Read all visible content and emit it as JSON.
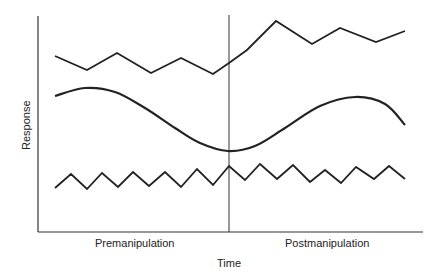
{
  "chart_data": {
    "type": "line",
    "title": "",
    "xlabel": "Time",
    "ylabel": "Response",
    "phases": [
      "Premanipulation",
      "Postmanipulation"
    ],
    "phase_divider_x": 229,
    "grid": false,
    "legend": null,
    "axes": {
      "x0": 38,
      "y0": 232,
      "x1": 423,
      "ytop": 16
    },
    "series": [
      {
        "name": "top-zigzag",
        "description": "Variable baseline, level increases after manipulation",
        "points": [
          [
            55,
            56
          ],
          [
            87,
            70
          ],
          [
            117,
            53
          ],
          [
            151,
            73
          ],
          [
            181,
            58
          ],
          [
            213,
            74
          ],
          [
            229,
            63
          ],
          [
            247,
            50
          ],
          [
            276,
            21
          ],
          [
            312,
            44
          ],
          [
            340,
            28
          ],
          [
            376,
            42
          ],
          [
            405,
            31
          ]
        ]
      },
      {
        "name": "smooth-curve",
        "description": "Cyclical trend: declines in premanipulation, rises then declines in postmanipulation",
        "points": [
          [
            55,
            96
          ],
          [
            85,
            88
          ],
          [
            115,
            92
          ],
          [
            145,
            108
          ],
          [
            175,
            128
          ],
          [
            200,
            143
          ],
          [
            228,
            151
          ],
          [
            255,
            146
          ],
          [
            285,
            128
          ],
          [
            320,
            106
          ],
          [
            355,
            97
          ],
          [
            385,
            104
          ],
          [
            405,
            125
          ]
        ]
      },
      {
        "name": "bottom-zigzag",
        "description": "Stable, regular oscillation across both phases",
        "points": [
          [
            55,
            188
          ],
          [
            71,
            174
          ],
          [
            87,
            189
          ],
          [
            102,
            173
          ],
          [
            118,
            187
          ],
          [
            133,
            172
          ],
          [
            149,
            186
          ],
          [
            165,
            172
          ],
          [
            181,
            187
          ],
          [
            197,
            169
          ],
          [
            213,
            185
          ],
          [
            229,
            166
          ],
          [
            245,
            180
          ],
          [
            260,
            164
          ],
          [
            277,
            179
          ],
          [
            293,
            165
          ],
          [
            310,
            182
          ],
          [
            325,
            170
          ],
          [
            341,
            183
          ],
          [
            356,
            167
          ],
          [
            374,
            179
          ],
          [
            389,
            166
          ],
          [
            405,
            179
          ]
        ]
      }
    ]
  },
  "labels": {
    "ylabel": "Response",
    "xlabel": "Time",
    "pre": "Premanipulation",
    "post": "Postmanipulation"
  },
  "colors": {
    "line": "#222222",
    "axis": "#333333",
    "background": "#ffffff"
  }
}
